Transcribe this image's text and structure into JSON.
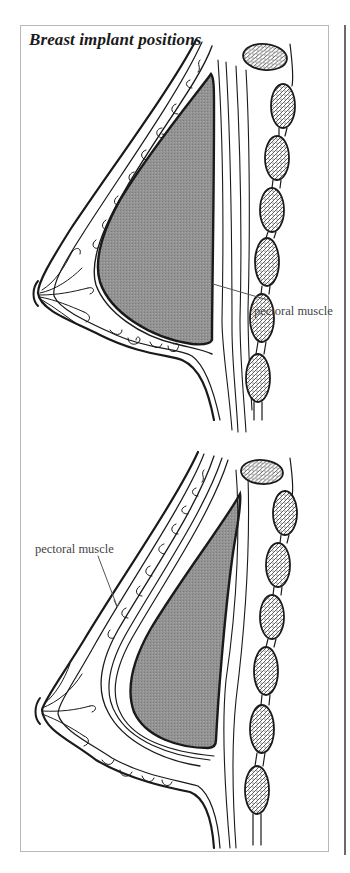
{
  "figure": {
    "title": "Breast implant positions",
    "panels": [
      {
        "id": "upper",
        "position": "implant behind breast tissue, in front of pectoral muscle",
        "label": "pectoral muscle"
      },
      {
        "id": "lower",
        "position": "implant behind pectoral muscle",
        "label": "pectoral muscle"
      }
    ]
  },
  "colors": {
    "implant_fill": "#8c8c8c",
    "line": "#1a1a1a",
    "frame": "#b8b8b8",
    "label_text": "#444444"
  }
}
